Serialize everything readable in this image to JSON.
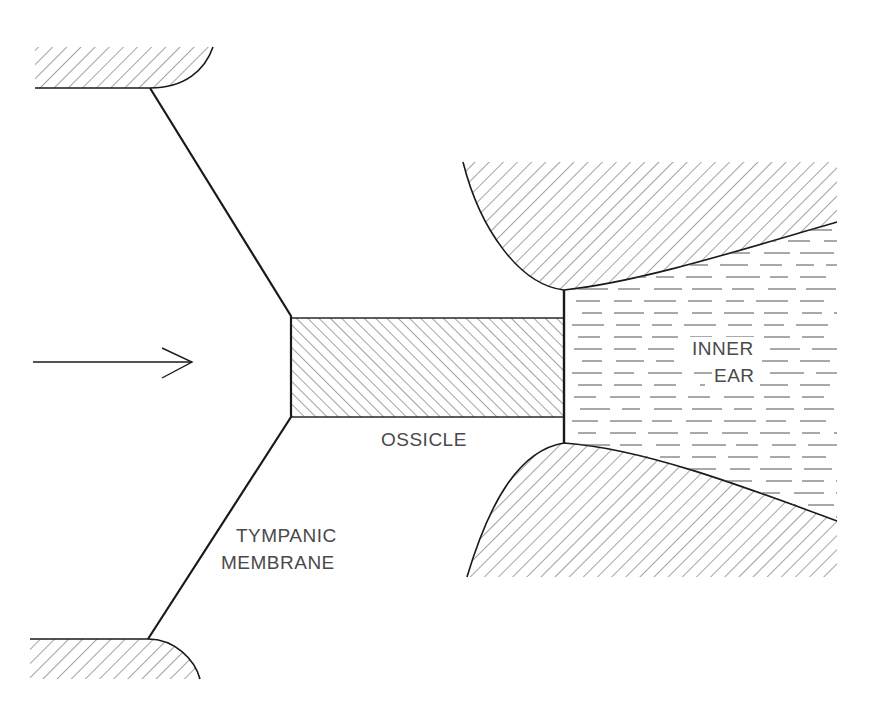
{
  "diagram": {
    "type": "schematic",
    "labels": {
      "ossicle": "OSSICLE",
      "inner_ear_line1": "INNER",
      "inner_ear_line2": "EAR",
      "tympanic_line1": "TYMPANIC",
      "tympanic_line2": "MEMBRANE"
    },
    "elements": [
      {
        "id": "sound-arrow",
        "kind": "arrow",
        "direction": "right"
      },
      {
        "id": "tympanic-membrane",
        "kind": "bent line"
      },
      {
        "id": "ossicle",
        "kind": "hatched rectangle"
      },
      {
        "id": "oval-window",
        "kind": "vertical line"
      },
      {
        "id": "inner-ear-fluid",
        "kind": "dashed fill region"
      },
      {
        "id": "bone-top-left",
        "kind": "hatched region"
      },
      {
        "id": "bone-bottom-left",
        "kind": "hatched region"
      },
      {
        "id": "bone-top-right",
        "kind": "hatched region"
      },
      {
        "id": "bone-bottom-right",
        "kind": "hatched region"
      }
    ],
    "colors": {
      "line": "#1a1a1a",
      "hatch": "#555555",
      "text": "#4a4a4a",
      "background": "#ffffff"
    }
  }
}
